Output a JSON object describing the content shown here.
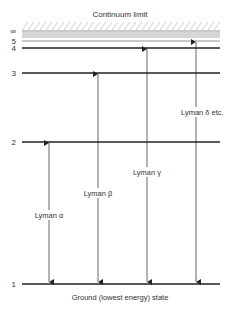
{
  "diagram": {
    "title": "Continuum limit",
    "footer": "Ground (lowest energy) state",
    "levels": [
      {
        "n": "∞",
        "label": "∞",
        "weight": "thin"
      },
      {
        "n": "5",
        "label": "5",
        "weight": "thin"
      },
      {
        "n": "4",
        "label": "4",
        "weight": "thick"
      },
      {
        "n": "3",
        "label": "3",
        "weight": "thick"
      },
      {
        "n": "2",
        "label": "2",
        "weight": "thick"
      },
      {
        "n": "1",
        "label": "1",
        "weight": "thick"
      }
    ],
    "transitions": [
      {
        "from": "2",
        "to": "1",
        "label": "Lyman α"
      },
      {
        "from": "3",
        "to": "1",
        "label": "Lyman β"
      },
      {
        "from": "4",
        "to": "1",
        "label": "Lyman γ"
      },
      {
        "from": "5",
        "to": "1",
        "label": "Lyman δ etc."
      }
    ],
    "colors": {
      "line": "#222222",
      "text": "#333333",
      "hatch": "#aaaaaa"
    }
  }
}
